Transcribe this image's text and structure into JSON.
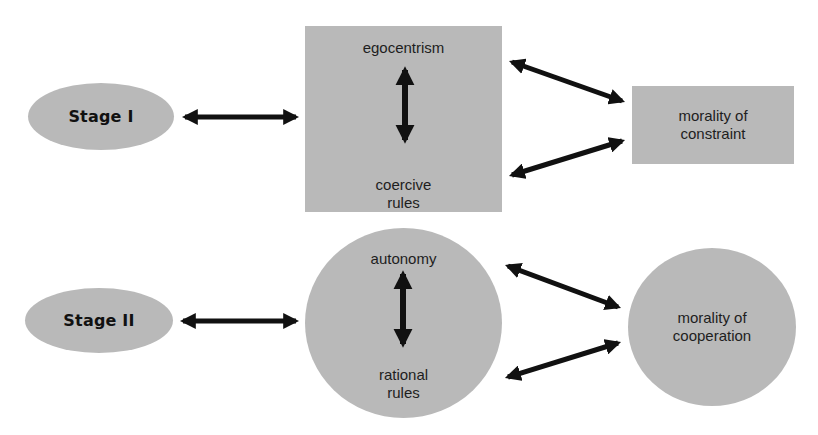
{
  "diagram": {
    "fill_color": "#b9b9b9",
    "arrow_color": "#111111",
    "row1": {
      "stage": {
        "label": "Stage I"
      },
      "center": {
        "top_label": "egocentrism",
        "bottom_line1": "coercive",
        "bottom_line2": "rules"
      },
      "outcome": {
        "line1": "morality of",
        "line2": "constraint"
      }
    },
    "row2": {
      "stage": {
        "label": "Stage II"
      },
      "center": {
        "top_label": "autonomy",
        "bottom_line1": "rational",
        "bottom_line2": "rules"
      },
      "outcome": {
        "line1": "morality of",
        "line2": "cooperation"
      }
    }
  }
}
